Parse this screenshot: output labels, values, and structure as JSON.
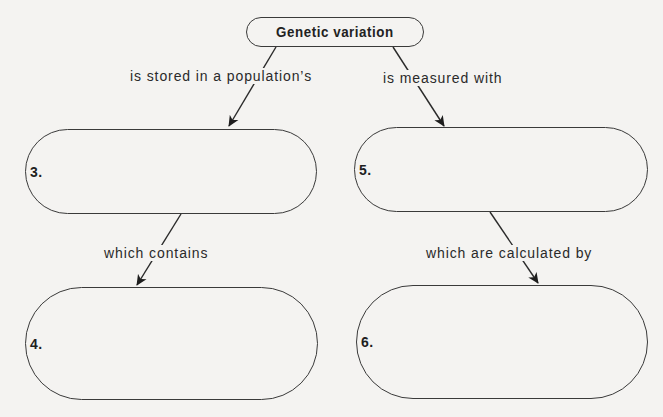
{
  "diagram": {
    "type": "concept-map",
    "root": {
      "label": "Genetic variation"
    },
    "nodes": [
      {
        "id": "3",
        "number_label": "3.",
        "content": ""
      },
      {
        "id": "4",
        "number_label": "4.",
        "content": ""
      },
      {
        "id": "5",
        "number_label": "5.",
        "content": ""
      },
      {
        "id": "6",
        "number_label": "6.",
        "content": ""
      }
    ],
    "links": [
      {
        "from": "root",
        "to": "3",
        "label": "is stored in a population’s"
      },
      {
        "from": "root",
        "to": "5",
        "label": "is measured with"
      },
      {
        "from": "3",
        "to": "4",
        "label": "which contains"
      },
      {
        "from": "5",
        "to": "6",
        "label": "which are calculated by"
      }
    ],
    "colors": {
      "background": "#f4f3f1",
      "stroke": "#3a3a3a",
      "text": "#222222"
    }
  }
}
